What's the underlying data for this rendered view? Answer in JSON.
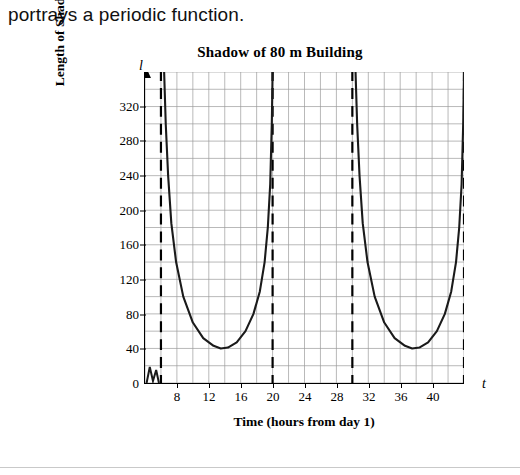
{
  "intro": {
    "text": "portrays a periodic function."
  },
  "chart_data": {
    "type": "line",
    "title": "Shadow of 80 m Building",
    "xlabel": "Time (hours from day 1)",
    "ylabel": "Length of Shadow (m)",
    "x_axis_symbol": "t",
    "y_axis_symbol": "l",
    "xlim": [
      4,
      44
    ],
    "ylim": [
      0,
      360
    ],
    "xticks": [
      8,
      12,
      16,
      20,
      24,
      28,
      32,
      36,
      40
    ],
    "yticks": [
      0,
      40,
      80,
      120,
      160,
      200,
      240,
      280,
      320
    ],
    "grid": true,
    "grid_minor_x_step": 2,
    "grid_minor_y_step": 20,
    "asymptotes": [
      6,
      20,
      30,
      44
    ],
    "asymptote_style": "dashed",
    "series": [
      {
        "name": "Shadow length",
        "points": [
          [
            6.4,
            360
          ],
          [
            6.6,
            300
          ],
          [
            6.9,
            240
          ],
          [
            7.3,
            185
          ],
          [
            7.9,
            140
          ],
          [
            8.8,
            100
          ],
          [
            10.0,
            70
          ],
          [
            11.3,
            52
          ],
          [
            12.6,
            43
          ],
          [
            13.5,
            40
          ],
          [
            14.4,
            41
          ],
          [
            15.5,
            47
          ],
          [
            16.6,
            60
          ],
          [
            17.6,
            80
          ],
          [
            18.4,
            106
          ],
          [
            19.0,
            140
          ],
          [
            19.4,
            180
          ],
          [
            19.7,
            230
          ],
          [
            19.9,
            300
          ],
          [
            20.0,
            360
          ]
        ]
      },
      {
        "name": "Shadow length (day 2)",
        "points": [
          [
            30.4,
            360
          ],
          [
            30.6,
            300
          ],
          [
            30.9,
            240
          ],
          [
            31.3,
            185
          ],
          [
            31.9,
            140
          ],
          [
            32.8,
            100
          ],
          [
            34.0,
            70
          ],
          [
            35.3,
            52
          ],
          [
            36.6,
            43
          ],
          [
            37.5,
            40
          ],
          [
            38.4,
            41
          ],
          [
            39.5,
            47
          ],
          [
            40.6,
            60
          ],
          [
            41.6,
            80
          ],
          [
            42.4,
            106
          ],
          [
            43.0,
            140
          ],
          [
            43.4,
            180
          ],
          [
            43.7,
            230
          ],
          [
            43.9,
            300
          ],
          [
            44.0,
            360
          ]
        ]
      }
    ],
    "origin_label": "0"
  }
}
